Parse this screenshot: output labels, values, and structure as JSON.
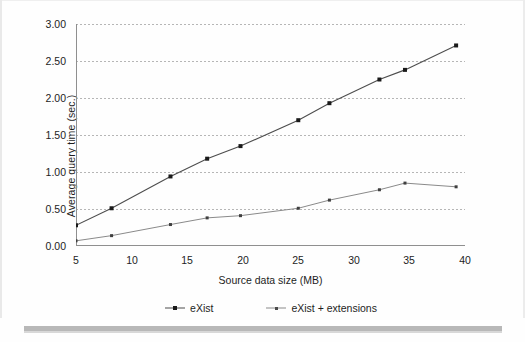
{
  "figure": {
    "kind": "line-chart-figure",
    "bottom_rule_color": "#b8b8b8"
  },
  "chart_data": {
    "type": "line",
    "title": "",
    "xlabel": "Source data size (MB)",
    "ylabel": "Average query time (sec.)",
    "xlim": [
      5,
      40
    ],
    "ylim": [
      0.0,
      3.0
    ],
    "xticks": [
      5,
      10,
      15,
      20,
      25,
      30,
      35,
      40
    ],
    "yticks": [
      0.0,
      0.5,
      1.0,
      1.5,
      2.0,
      2.5,
      3.0
    ],
    "xtick_labels": [
      "5",
      "10",
      "15",
      "20",
      "25",
      "30",
      "35",
      "40"
    ],
    "ytick_labels": [
      "0.00",
      "0.50",
      "1.00",
      "1.50",
      "2.00",
      "2.50",
      "3.00"
    ],
    "grid": "horizontal-dotted",
    "legend_position": "bottom",
    "series": [
      {
        "name": "eXist",
        "color": "#4d4d4d",
        "marker": "square",
        "x": [
          5.0,
          8.2,
          13.5,
          16.8,
          19.8,
          25.0,
          27.8,
          32.3,
          34.6,
          39.2
        ],
        "values": [
          0.28,
          0.51,
          0.94,
          1.18,
          1.35,
          1.7,
          1.93,
          2.25,
          2.38,
          2.71
        ]
      },
      {
        "name": "eXist + extensions",
        "color": "#8a8a8a",
        "marker": "square-small",
        "x": [
          5.0,
          8.2,
          13.5,
          16.8,
          19.8,
          25.0,
          27.8,
          32.3,
          34.6,
          39.2
        ],
        "values": [
          0.07,
          0.14,
          0.29,
          0.38,
          0.41,
          0.51,
          0.62,
          0.76,
          0.85,
          0.8
        ]
      }
    ]
  },
  "axes": {
    "y_title": "Average query time (sec.)",
    "x_title": "Source data size (MB)",
    "y_labels": [
      "3.00",
      "2.50",
      "2.00",
      "1.50",
      "1.00",
      "0.50",
      "0.00"
    ],
    "x_labels": [
      "5",
      "10",
      "15",
      "20",
      "25",
      "30",
      "35",
      "40"
    ]
  },
  "legend": {
    "items": [
      {
        "label": "eXist"
      },
      {
        "label": "eXist + extensions"
      }
    ]
  }
}
